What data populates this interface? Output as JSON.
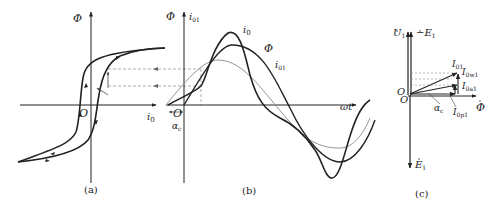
{
  "figure": {
    "panel_a": {
      "caption": "(a)",
      "y_axis_label": "Φ",
      "x_axis_label": "i",
      "x_axis_sub": "0",
      "origin_label": "O",
      "curve": "hysteresis loop"
    },
    "panel_b": {
      "caption": "(b)",
      "y_axis_label_1": "Φ",
      "y_axis_label_2": "i",
      "y_axis_label_2_sub": "01",
      "x_axis_label": "ωt",
      "origin_label": "O",
      "angle_label": "α",
      "angle_sub": "c",
      "curve_labels": {
        "i0": "i",
        "i0_sub": "0",
        "phi": "Φ",
        "i01": "i",
        "i01_sub": "01"
      }
    },
    "panel_c": {
      "caption": "(c)",
      "u1_label": "U",
      "u1_sub": "1",
      "neg_e1_label": "−E",
      "neg_e1_sub": "1",
      "e1_label": "E",
      "e1_sub": "1",
      "phi_label": "Φ",
      "origin_label": "O",
      "i01_label": "I",
      "i01_sub": "01",
      "i0w1_label": "I",
      "i0w1_sub": "0w1",
      "i0a1_label": "I",
      "i0a1_sub": "0a1",
      "i0p1_label": "I",
      "i0p1_sub": "0p1",
      "angle_label": "α",
      "angle_sub": "c"
    }
  },
  "colors": {
    "ink": "#222222",
    "thin": "#777777",
    "dashed": "#888888"
  }
}
